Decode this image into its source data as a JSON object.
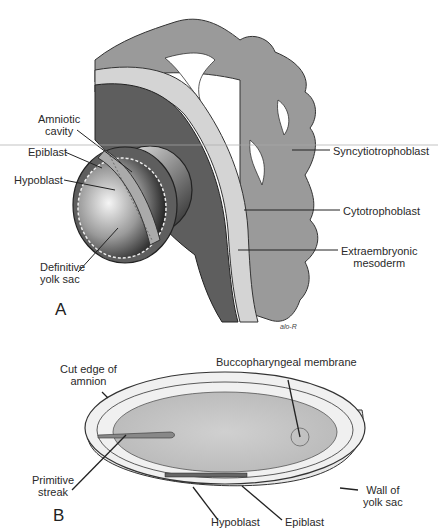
{
  "figure": {
    "panel_a": {
      "letter": "A",
      "labels": {
        "amniotic_cavity_1": "Amniotic",
        "amniotic_cavity_2": "cavity",
        "epiblast": "Epiblast",
        "hypoblast": "Hypoblast",
        "definitive_yolk_sac_1": "Definitive",
        "definitive_yolk_sac_2": "yolk sac",
        "syncytiotrophoblast": "Syncytiotrophoblast",
        "cytotrophoblast": "Cytotrophoblast",
        "extraembryonic_mesoderm_1": "Extraembryonic",
        "extraembryonic_mesoderm_2": "mesoderm"
      },
      "signature": "alo-R"
    },
    "panel_b": {
      "letter": "B",
      "labels": {
        "cut_edge_1": "Cut edge of",
        "cut_edge_2": "amnion",
        "buccopharyngeal": "Buccopharyngeal membrane",
        "primitive_streak_1": "Primitive",
        "primitive_streak_2": "streak",
        "wall_yolk_sac_1": "Wall of",
        "wall_yolk_sac_2": "yolk sac",
        "hypoblast": "Hypoblast",
        "epiblast": "Epiblast"
      }
    },
    "colors": {
      "syncytiotrophoblast": "#9a9a9a",
      "cytotrophoblast": "#d4d4d4",
      "mesoderm": "#5e5e5e",
      "embryonic_disc": "#c8c8c8",
      "yolk_wall": "#e8e8e8"
    }
  }
}
